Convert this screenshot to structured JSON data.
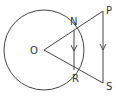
{
  "diagram": {
    "type": "geometry",
    "colors": {
      "line": "#444444",
      "label": "#333333",
      "background": "#ffffff"
    },
    "circle": {
      "center_label": "O",
      "cx": 44,
      "cy": 50,
      "r": 40
    },
    "points": {
      "O": {
        "label": "O",
        "x": 44,
        "y": 50
      },
      "N": {
        "label": "N",
        "x": 74,
        "y": 30
      },
      "R": {
        "label": "R",
        "x": 74,
        "y": 70
      },
      "P": {
        "label": "P",
        "x": 103,
        "y": 11
      },
      "S": {
        "label": "S",
        "x": 103,
        "y": 83
      }
    },
    "segments": [
      "OP",
      "OS",
      "NR",
      "PS"
    ],
    "parallel_marks": [
      "NR",
      "PS"
    ]
  }
}
